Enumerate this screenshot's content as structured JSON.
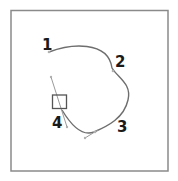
{
  "diagram": {
    "type": "bezier-path",
    "frame": {
      "stroke": "#8a8a8a"
    },
    "path": {
      "stroke": "#6e6e6e"
    },
    "handle": {
      "stroke": "#9a9a9a"
    },
    "selected_anchor": {
      "stroke": "#555555"
    },
    "points": [
      {
        "label": "1"
      },
      {
        "label": "2"
      },
      {
        "label": "3"
      },
      {
        "label": "4"
      }
    ]
  }
}
